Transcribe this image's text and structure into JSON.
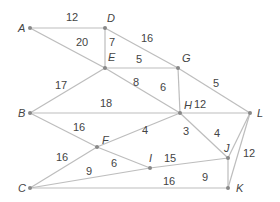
{
  "graph": {
    "nodes": [
      {
        "id": "A",
        "x": 30,
        "y": 28,
        "lx": -12,
        "ly": 4
      },
      {
        "id": "D",
        "x": 105,
        "y": 28,
        "lx": 2,
        "ly": -6
      },
      {
        "id": "E",
        "x": 105,
        "y": 68,
        "lx": 3,
        "ly": -7
      },
      {
        "id": "G",
        "x": 178,
        "y": 68,
        "lx": 4,
        "ly": -6
      },
      {
        "id": "B",
        "x": 30,
        "y": 113,
        "lx": -12,
        "ly": 4
      },
      {
        "id": "H",
        "x": 180,
        "y": 113,
        "lx": 4,
        "ly": -4
      },
      {
        "id": "L",
        "x": 250,
        "y": 113,
        "lx": 7,
        "ly": 4
      },
      {
        "id": "F",
        "x": 97,
        "y": 147,
        "lx": 5,
        "ly": -3
      },
      {
        "id": "I",
        "x": 150,
        "y": 168,
        "lx": -1,
        "ly": -6
      },
      {
        "id": "J",
        "x": 228,
        "y": 158,
        "lx": -4,
        "ly": -6
      },
      {
        "id": "C",
        "x": 30,
        "y": 188,
        "lx": -12,
        "ly": 4
      },
      {
        "id": "K",
        "x": 228,
        "y": 188,
        "lx": 8,
        "ly": 4
      }
    ],
    "edges": [
      {
        "from": "A",
        "to": "D",
        "w": "12",
        "lx": 66,
        "ly": 21
      },
      {
        "from": "A",
        "to": "E",
        "w": "20",
        "lx": 76,
        "ly": 46
      },
      {
        "from": "D",
        "to": "E",
        "w": "7",
        "lx": 109,
        "ly": 46
      },
      {
        "from": "D",
        "to": "G",
        "w": "16",
        "lx": 141,
        "ly": 42
      },
      {
        "from": "G",
        "to": "L",
        "w": "5",
        "lx": 213,
        "ly": 87
      },
      {
        "from": "E",
        "to": "G",
        "w": "5",
        "lx": 136,
        "ly": 63
      },
      {
        "from": "E",
        "to": "H",
        "w": "8",
        "lx": 133,
        "ly": 86
      },
      {
        "from": "G",
        "to": "H",
        "w": "6",
        "lx": 160,
        "ly": 91
      },
      {
        "from": "B",
        "to": "E",
        "w": "17",
        "lx": 55,
        "ly": 89
      },
      {
        "from": "B",
        "to": "H",
        "w": "18",
        "lx": 100,
        "ly": 107
      },
      {
        "from": "B",
        "to": "F",
        "w": "16",
        "lx": 73,
        "ly": 131
      },
      {
        "from": "F",
        "to": "I",
        "w": "6",
        "lx": 111,
        "ly": 167
      },
      {
        "from": "C",
        "to": "F",
        "w": "16",
        "lx": 56,
        "ly": 161
      },
      {
        "from": "F",
        "to": "H",
        "w": "4",
        "lx": 142,
        "ly": 134
      },
      {
        "from": "C",
        "to": "I",
        "w": "9",
        "lx": 86,
        "ly": 175
      },
      {
        "from": "I",
        "to": "J",
        "w": "15",
        "lx": 164,
        "ly": 162
      },
      {
        "from": "C",
        "to": "K",
        "w": "16",
        "lx": 163,
        "ly": 185
      },
      {
        "from": "H",
        "to": "L",
        "w": "12",
        "lx": 194,
        "ly": 108
      },
      {
        "from": "H",
        "to": "J",
        "w": "3",
        "lx": 183,
        "ly": 135
      },
      {
        "from": "J",
        "to": "L",
        "w": "4",
        "lx": 214,
        "ly": 137
      },
      {
        "from": "J",
        "to": "K",
        "w": "9",
        "lx": 202,
        "ly": 181
      },
      {
        "from": "L",
        "to": "K",
        "w": "12",
        "lx": 243,
        "ly": 157
      }
    ]
  }
}
